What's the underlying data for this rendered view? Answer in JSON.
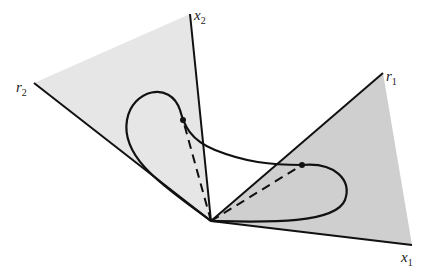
{
  "diagram": {
    "type": "cone-trajectory",
    "colors": {
      "cone_left_fill": "#e6e6e6",
      "cone_right_fill": "#cfcfcf",
      "stroke": "#111111"
    },
    "origin": [
      211,
      221
    ],
    "axes": [
      {
        "id": "x2",
        "label": "x",
        "subscript": "2",
        "end": [
          190,
          14
        ],
        "label_pos": [
          194,
          20
        ]
      },
      {
        "id": "r2",
        "label": "r",
        "subscript": "2",
        "end": [
          34,
          83
        ],
        "label_pos": [
          16,
          92
        ]
      },
      {
        "id": "r1",
        "label": "r",
        "subscript": "1",
        "end": [
          383,
          73
        ],
        "label_pos": [
          386,
          81
        ]
      },
      {
        "id": "x1",
        "label": "x",
        "subscript": "1",
        "end": [
          412,
          245
        ],
        "label_pos": [
          401,
          262
        ]
      }
    ],
    "points": [
      {
        "id": "left-point",
        "pos": [
          183,
          120
        ]
      },
      {
        "id": "right-point",
        "pos": [
          302,
          165
        ]
      }
    ]
  }
}
